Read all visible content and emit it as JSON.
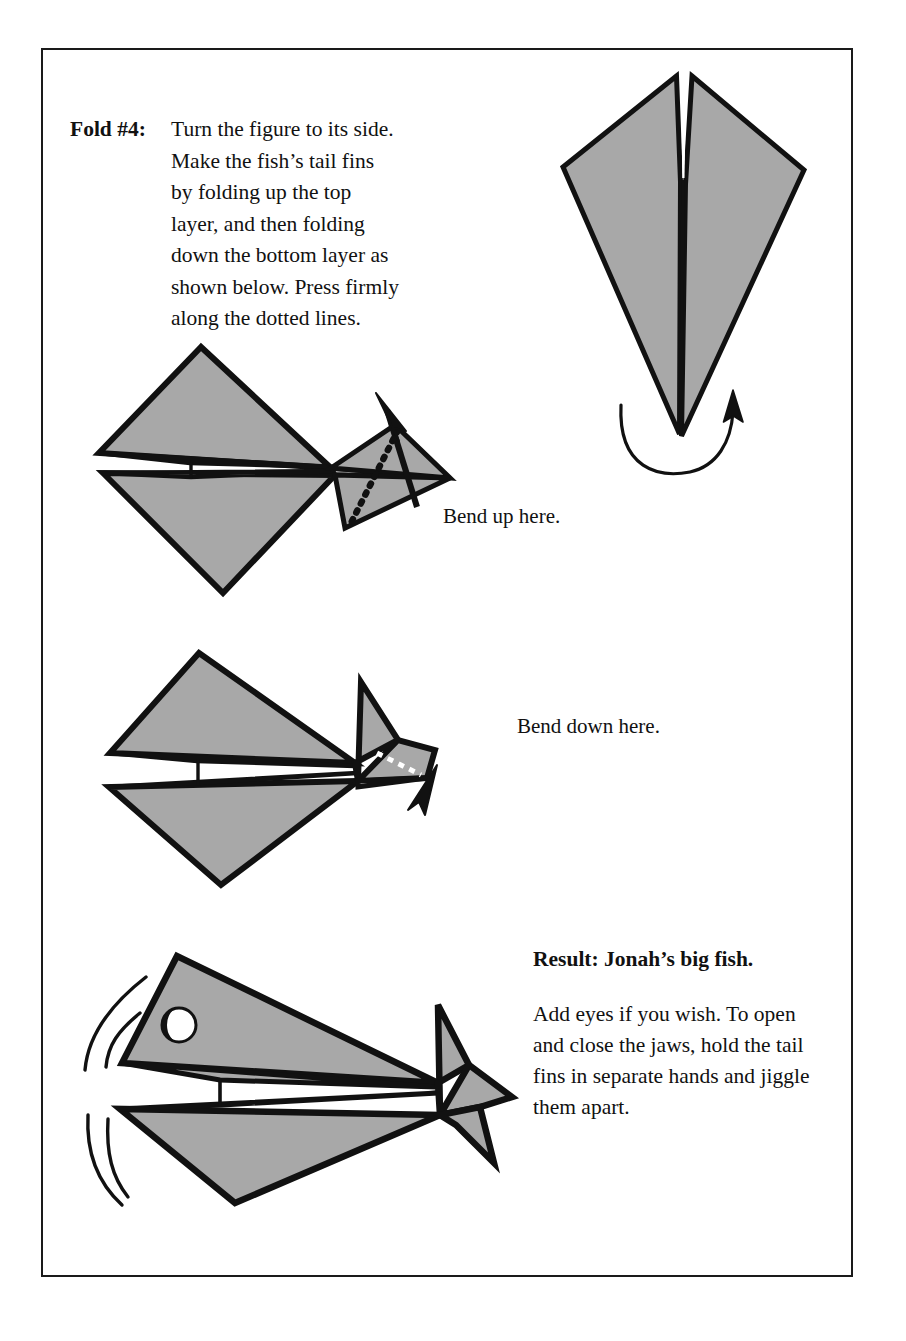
{
  "page": {
    "background_color": "#ffffff",
    "border_color": "#1a1a1a",
    "paper_fill": "#a8a8a8",
    "ink_color": "#111111"
  },
  "fold_instruction": {
    "label": "Fold #4:",
    "body": "Turn the figure to its side. Make the fish’s tail fins by folding up the top layer, and then folding down the bottom layer as shown below. Press firmly along the dotted lines."
  },
  "captions": {
    "bend_up": "Bend up here.",
    "bend_down": "Bend down here."
  },
  "result": {
    "title": "Result: Jonah’s big fish.",
    "body": "Add eyes if you wish. To open and close the jaws, hold the tail fins in separate hands and jiggle them apart."
  },
  "figures": [
    {
      "name": "kite-front-view",
      "description": "Folded kite shape seen from the front with a narrow central notch, plus a curved rotation arrow beneath indicating turning the figure to its side."
    },
    {
      "name": "fish-step-bend-up",
      "description": "Side view of the folded fish with a dotted fold line across the tail and an arrow pointing up-left."
    },
    {
      "name": "fish-step-bend-down",
      "description": "Side view of the fish with the upper tail fin raised, a dotted fold line on the lower tail and an arrow pointing down-right."
    },
    {
      "name": "fish-result",
      "description": "Finished fish with both tail fins formed, an eye, and motion arcs at the mouth."
    }
  ]
}
